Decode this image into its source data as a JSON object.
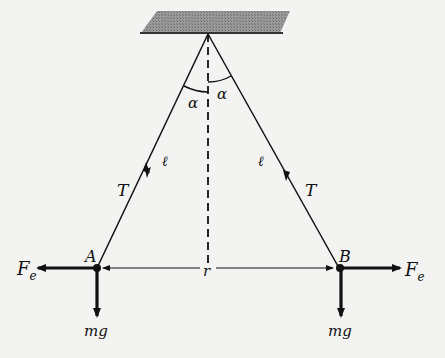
{
  "diagram": {
    "type": "physics-free-body",
    "labels": {
      "angle_left": "α",
      "angle_right": "α",
      "length_left": "ℓ",
      "length_right": "ℓ",
      "tension_left": "T",
      "tension_right": "T",
      "point_a": "A",
      "point_b": "B",
      "separation": "r",
      "force_electric_left": "F",
      "force_electric_left_sub": "e",
      "force_electric_right": "F",
      "force_electric_right_sub": "e",
      "weight_left": "mg",
      "weight_right": "mg"
    },
    "colors": {
      "ink": "#111111",
      "ceiling": "#8a8a8a",
      "background": "#f3f3f2"
    }
  }
}
